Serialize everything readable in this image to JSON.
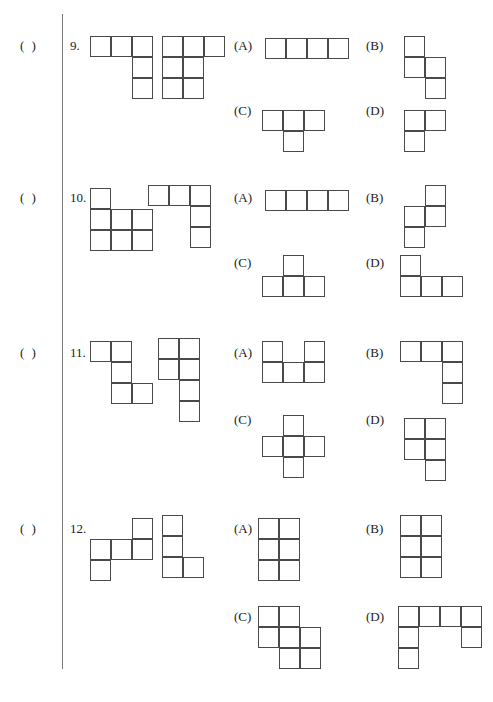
{
  "page": {
    "kind": "math-worksheet",
    "cell_size": 21,
    "line_color": "#4a4a4a",
    "rule_color": "#7a7a7a",
    "text_color": "#222222",
    "background": "#ffffff"
  },
  "questions": [
    {
      "answer_blank": "(    )",
      "number": "9.",
      "blank_top": 38,
      "number_top": 38,
      "prompt_figures": [
        {
          "name": "prompt-figure-1",
          "left": 90,
          "top": 36,
          "cols": 3,
          "rows": 3,
          "cells": [
            [
              0,
              0
            ],
            [
              0,
              1
            ],
            [
              0,
              2
            ],
            [
              1,
              2
            ],
            [
              2,
              2
            ]
          ]
        },
        {
          "name": "prompt-figure-2",
          "left": 162,
          "top": 36,
          "cols": 3,
          "rows": 3,
          "cells": [
            [
              0,
              0
            ],
            [
              0,
              1
            ],
            [
              0,
              2
            ],
            [
              1,
              0
            ],
            [
              1,
              1
            ],
            [
              2,
              0
            ],
            [
              2,
              1
            ]
          ]
        }
      ],
      "options": [
        {
          "label": "(A)",
          "label_left": 234,
          "label_top": 38,
          "figure": {
            "name": "option-figure-a",
            "left": 265,
            "top": 38,
            "cols": 4,
            "rows": 1,
            "cells": [
              [
                0,
                0
              ],
              [
                0,
                1
              ],
              [
                0,
                2
              ],
              [
                0,
                3
              ]
            ]
          }
        },
        {
          "label": "(B)",
          "label_left": 366,
          "label_top": 38,
          "figure": {
            "name": "option-figure-b",
            "left": 404,
            "top": 36,
            "cols": 2,
            "rows": 3,
            "cells": [
              [
                0,
                0
              ],
              [
                1,
                0
              ],
              [
                1,
                1
              ],
              [
                2,
                1
              ]
            ]
          }
        },
        {
          "label": "(C)",
          "label_left": 234,
          "label_top": 103,
          "figure": {
            "name": "option-figure-c",
            "left": 262,
            "top": 110,
            "cols": 3,
            "rows": 2,
            "cells": [
              [
                0,
                0
              ],
              [
                0,
                1
              ],
              [
                0,
                2
              ],
              [
                1,
                1
              ]
            ]
          }
        },
        {
          "label": "(D)",
          "label_left": 366,
          "label_top": 103,
          "figure": {
            "name": "option-figure-d",
            "left": 404,
            "top": 110,
            "cols": 2,
            "rows": 2,
            "cells": [
              [
                0,
                0
              ],
              [
                0,
                1
              ],
              [
                1,
                0
              ]
            ]
          }
        }
      ]
    },
    {
      "answer_blank": "(    )",
      "number": "10.",
      "blank_top": 190,
      "number_top": 190,
      "prompt_figures": [
        {
          "name": "prompt-figure-1",
          "left": 90,
          "top": 188,
          "cols": 3,
          "rows": 3,
          "cells": [
            [
              0,
              0
            ],
            [
              1,
              0
            ],
            [
              1,
              1
            ],
            [
              1,
              2
            ],
            [
              2,
              0
            ],
            [
              2,
              1
            ],
            [
              2,
              2
            ]
          ]
        },
        {
          "name": "prompt-figure-2",
          "left": 148,
          "top": 185,
          "cols": 3,
          "rows": 3,
          "cells": [
            [
              0,
              0
            ],
            [
              0,
              1
            ],
            [
              0,
              2
            ],
            [
              1,
              2
            ],
            [
              2,
              2
            ]
          ]
        }
      ],
      "options": [
        {
          "label": "(A)",
          "label_left": 234,
          "label_top": 190,
          "figure": {
            "name": "option-figure-a",
            "left": 265,
            "top": 190,
            "cols": 4,
            "rows": 1,
            "cells": [
              [
                0,
                0
              ],
              [
                0,
                1
              ],
              [
                0,
                2
              ],
              [
                0,
                3
              ]
            ]
          }
        },
        {
          "label": "(B)",
          "label_left": 366,
          "label_top": 190,
          "figure": {
            "name": "option-figure-b",
            "left": 404,
            "top": 185,
            "cols": 2,
            "rows": 3,
            "cells": [
              [
                0,
                1
              ],
              [
                1,
                0
              ],
              [
                1,
                1
              ],
              [
                2,
                0
              ]
            ]
          }
        },
        {
          "label": "(C)",
          "label_left": 234,
          "label_top": 255,
          "figure": {
            "name": "option-figure-c",
            "left": 262,
            "top": 255,
            "cols": 3,
            "rows": 2,
            "cells": [
              [
                0,
                1
              ],
              [
                1,
                0
              ],
              [
                1,
                1
              ],
              [
                1,
                2
              ]
            ]
          }
        },
        {
          "label": "(D)",
          "label_left": 366,
          "label_top": 255,
          "figure": {
            "name": "option-figure-d",
            "left": 400,
            "top": 255,
            "cols": 3,
            "rows": 2,
            "cells": [
              [
                0,
                0
              ],
              [
                1,
                0
              ],
              [
                1,
                1
              ],
              [
                1,
                2
              ]
            ]
          }
        }
      ]
    },
    {
      "answer_blank": "(    )",
      "number": "11.",
      "blank_top": 345,
      "number_top": 345,
      "prompt_figures": [
        {
          "name": "prompt-figure-1",
          "left": 90,
          "top": 341,
          "cols": 3,
          "rows": 3,
          "cells": [
            [
              0,
              0
            ],
            [
              0,
              1
            ],
            [
              1,
              1
            ],
            [
              2,
              1
            ],
            [
              2,
              2
            ]
          ]
        },
        {
          "name": "prompt-figure-2",
          "left": 158,
          "top": 338,
          "cols": 2,
          "rows": 4,
          "cells": [
            [
              0,
              0
            ],
            [
              0,
              1
            ],
            [
              1,
              0
            ],
            [
              1,
              1
            ],
            [
              2,
              1
            ],
            [
              3,
              1
            ]
          ]
        }
      ],
      "options": [
        {
          "label": "(A)",
          "label_left": 234,
          "label_top": 345,
          "figure": {
            "name": "option-figure-a",
            "left": 262,
            "top": 341,
            "cols": 3,
            "rows": 2,
            "cells": [
              [
                0,
                0
              ],
              [
                0,
                2
              ],
              [
                1,
                0
              ],
              [
                1,
                1
              ],
              [
                1,
                2
              ]
            ]
          }
        },
        {
          "label": "(B)",
          "label_left": 366,
          "label_top": 345,
          "figure": {
            "name": "option-figure-b",
            "left": 400,
            "top": 341,
            "cols": 3,
            "rows": 3,
            "cells": [
              [
                0,
                0
              ],
              [
                0,
                1
              ],
              [
                0,
                2
              ],
              [
                1,
                2
              ],
              [
                2,
                2
              ]
            ]
          }
        },
        {
          "label": "(C)",
          "label_left": 234,
          "label_top": 412,
          "figure": {
            "name": "option-figure-c",
            "left": 262,
            "top": 415,
            "cols": 3,
            "rows": 3,
            "cells": [
              [
                0,
                1
              ],
              [
                1,
                0
              ],
              [
                1,
                1
              ],
              [
                1,
                2
              ],
              [
                2,
                1
              ]
            ]
          }
        },
        {
          "label": "(D)",
          "label_left": 366,
          "label_top": 412,
          "figure": {
            "name": "option-figure-d",
            "left": 404,
            "top": 418,
            "cols": 2,
            "rows": 3,
            "cells": [
              [
                0,
                0
              ],
              [
                0,
                1
              ],
              [
                1,
                0
              ],
              [
                1,
                1
              ],
              [
                2,
                1
              ]
            ]
          }
        }
      ]
    },
    {
      "answer_blank": "(    )",
      "number": "12.",
      "blank_top": 521,
      "number_top": 521,
      "prompt_figures": [
        {
          "name": "prompt-figure-1",
          "left": 90,
          "top": 518,
          "cols": 3,
          "rows": 3,
          "cells": [
            [
              0,
              2
            ],
            [
              1,
              0
            ],
            [
              1,
              1
            ],
            [
              1,
              2
            ],
            [
              2,
              0
            ]
          ]
        },
        {
          "name": "prompt-figure-2",
          "left": 162,
          "top": 515,
          "cols": 2,
          "rows": 3,
          "cells": [
            [
              0,
              0
            ],
            [
              1,
              0
            ],
            [
              2,
              0
            ],
            [
              2,
              1
            ]
          ]
        }
      ],
      "options": [
        {
          "label": "(A)",
          "label_left": 234,
          "label_top": 521,
          "figure": {
            "name": "option-figure-a",
            "left": 258,
            "top": 518,
            "cols": 2,
            "rows": 3,
            "cells": [
              [
                0,
                0
              ],
              [
                0,
                1
              ],
              [
                1,
                0
              ],
              [
                1,
                1
              ],
              [
                2,
                0
              ],
              [
                2,
                1
              ]
            ]
          }
        },
        {
          "label": "(B)",
          "label_left": 366,
          "label_top": 521,
          "figure": {
            "name": "option-figure-b",
            "left": 400,
            "top": 515,
            "cols": 2,
            "rows": 3,
            "cells": [
              [
                0,
                0
              ],
              [
                0,
                1
              ],
              [
                1,
                0
              ],
              [
                1,
                1
              ],
              [
                2,
                0
              ],
              [
                2,
                1
              ]
            ]
          }
        },
        {
          "label": "(C)",
          "label_left": 234,
          "label_top": 609,
          "figure": {
            "name": "option-figure-c",
            "left": 258,
            "top": 606,
            "cols": 3,
            "rows": 3,
            "cells": [
              [
                0,
                0
              ],
              [
                0,
                1
              ],
              [
                1,
                0
              ],
              [
                1,
                1
              ],
              [
                1,
                2
              ],
              [
                2,
                1
              ],
              [
                2,
                2
              ]
            ]
          }
        },
        {
          "label": "(D)",
          "label_left": 366,
          "label_top": 609,
          "figure": {
            "name": "option-figure-d",
            "left": 398,
            "top": 606,
            "cols": 4,
            "rows": 3,
            "cells": [
              [
                0,
                0
              ],
              [
                0,
                1
              ],
              [
                0,
                2
              ],
              [
                0,
                3
              ],
              [
                1,
                0
              ],
              [
                1,
                3
              ],
              [
                2,
                0
              ]
            ]
          }
        }
      ]
    }
  ]
}
